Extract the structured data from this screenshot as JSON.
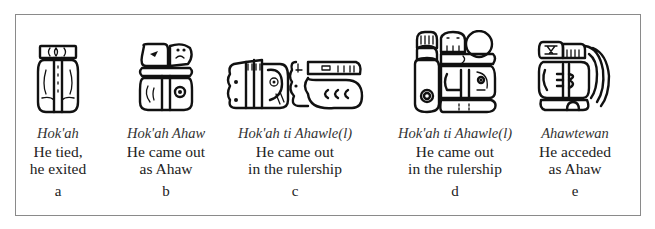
{
  "figure": {
    "panels": [
      {
        "id": "a",
        "transliteration": "Hok'ah",
        "translation_line1": "He tied,",
        "translation_line2": "he exited",
        "label": "a",
        "glyph": "hokah-glyph"
      },
      {
        "id": "b",
        "transliteration": "Hok'ah Ahaw",
        "translation_line1": "He came out",
        "translation_line2": "as Ahaw",
        "label": "b",
        "glyph": "hokah-ahaw-glyph"
      },
      {
        "id": "c",
        "transliteration": "Hok'ah ti Ahawle(l)",
        "translation_line1": "He came out",
        "translation_line2": "in the rulership",
        "label": "c",
        "glyph": "hokah-ti-ahawlel-glyph-horizontal"
      },
      {
        "id": "d",
        "transliteration": "Hok'ah ti Ahawle(l)",
        "translation_line1": "He came out",
        "translation_line2": "in the rulership",
        "label": "d",
        "glyph": "hokah-ti-ahawlel-glyph-compound"
      },
      {
        "id": "e",
        "transliteration": "Ahawtewan",
        "translation_line1": "He acceded",
        "translation_line2": "as Ahaw",
        "label": "e",
        "glyph": "ahawtewan-glyph"
      }
    ],
    "colors": {
      "border": "#8a8a8a",
      "ink": "#111111",
      "background": "#ffffff"
    }
  }
}
